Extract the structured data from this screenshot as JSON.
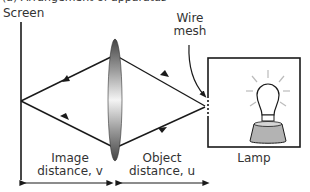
{
  "caption_partial": "(a) Arrangement of apparatus",
  "labels": {
    "screen": "Screen",
    "wire_mesh_line1": "Wire",
    "wire_mesh_line2": "mesh",
    "lamp": "Lamp",
    "image_distance_line1": "Image",
    "image_distance_line2": "distance, v",
    "object_distance_line1": "Object",
    "object_distance_line2": "distance, u"
  },
  "colors": {
    "line": "#1a1a1a",
    "lens_dark": "#555555",
    "lens_light": "#f2f2f2",
    "lamp_base": "#b3b3b3",
    "rays_glow": "#bbbbbb"
  }
}
